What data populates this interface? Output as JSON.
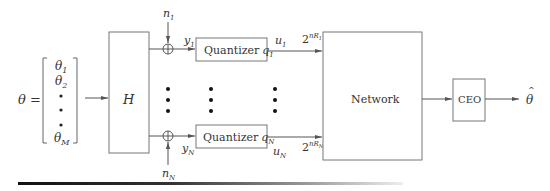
{
  "diagram": {
    "input": {
      "lhs_label": "θ =",
      "vector_entries": [
        "θ1",
        "θ2",
        "•",
        "•",
        "•",
        "θM"
      ],
      "entries_display": [
        {
          "base": "θ",
          "sub": "1"
        },
        {
          "base": "θ",
          "sub": "2"
        },
        {
          "base": "•",
          "sub": ""
        },
        {
          "base": "•",
          "sub": ""
        },
        {
          "base": "•",
          "sub": ""
        },
        {
          "base": "θ",
          "sub": "M"
        }
      ]
    },
    "blocks": {
      "h": {
        "label": "H"
      },
      "quantizer_1": {
        "label": "Quantizer",
        "sym": "q",
        "sub": "1"
      },
      "quantizer_n": {
        "label": "Quantizer",
        "sym": "q",
        "sub": "N"
      },
      "network": {
        "label": "Network"
      },
      "ceo": {
        "label": "CEO"
      }
    },
    "signals": {
      "noise_1": {
        "base": "n",
        "sub": "1"
      },
      "noise_n": {
        "base": "n",
        "sub": "N"
      },
      "y_1": {
        "base": "y",
        "sub": "1"
      },
      "y_n": {
        "base": "y",
        "sub": "N"
      },
      "u_1": {
        "base": "u",
        "sub": "1"
      },
      "u_n": {
        "base": "u",
        "sub": "N"
      },
      "rate_1": {
        "base": "2",
        "sup": "nR",
        "sup_sub": "1"
      },
      "rate_n": {
        "base": "2",
        "sup": "nR",
        "sup_sub": "N"
      },
      "output": {
        "base": "θ",
        "accent": "^"
      }
    },
    "ellipsis": "⋮",
    "adder_symbol": "⊕"
  }
}
